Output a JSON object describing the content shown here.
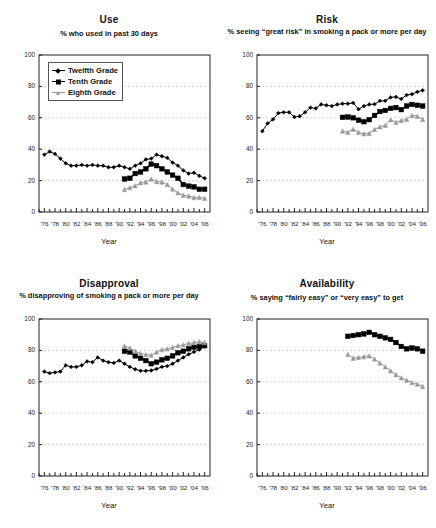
{
  "figure": {
    "background": "#ffffff",
    "axis_label": "Year",
    "y_ticks": [
      "0",
      "20",
      "40",
      "60",
      "80",
      "100"
    ],
    "y_values": [
      0,
      20,
      40,
      60,
      80,
      100
    ],
    "x_tick_labels": [
      "'76",
      "'78",
      "'80",
      "'82",
      "'84",
      "'86",
      "'88",
      "'90",
      "'92",
      "'94",
      "'96",
      "'98",
      "'00",
      "'02",
      "'04",
      "'06"
    ],
    "x_tick_years": [
      1976,
      1978,
      1980,
      1982,
      1984,
      1986,
      1988,
      1990,
      1992,
      1994,
      1996,
      1998,
      2000,
      2002,
      2004,
      2006
    ],
    "x_range": [
      1975,
      2007
    ],
    "grid_color": "#bbbbbb",
    "series_colors": {
      "twelfth": "#000000",
      "tenth": "#000000",
      "eighth": "#9a9a9a"
    },
    "legend": {
      "items": [
        {
          "key": "twelfth",
          "label": "Twelfth Grade",
          "marker": "diamond",
          "color": "#000000"
        },
        {
          "key": "tenth",
          "label": "Tenth Grade",
          "marker": "square",
          "color": "#000000"
        },
        {
          "key": "eighth",
          "label": "Eighth Grade",
          "marker": "triangle",
          "color": "#9a9a9a"
        }
      ]
    }
  },
  "chart_data": [
    {
      "type": "line",
      "panel": "use",
      "title": "Use",
      "subtitle": "% who used in past 30 days",
      "xlabel": "Year",
      "ylabel": "",
      "ylim": [
        0,
        100
      ],
      "xlim": [
        1975,
        2007
      ],
      "grid": true,
      "legend": "inside-top-left",
      "series": [
        {
          "name": "Twelfth Grade",
          "color": "#000000",
          "marker": "diamond",
          "x": [
            1976,
            1977,
            1978,
            1979,
            1980,
            1981,
            1982,
            1983,
            1984,
            1985,
            1986,
            1987,
            1988,
            1989,
            1990,
            1991,
            1992,
            1993,
            1994,
            1995,
            1996,
            1997,
            1998,
            1999,
            2000,
            2001,
            2002,
            2003,
            2004,
            2005,
            2006
          ],
          "values": [
            36.5,
            38.5,
            37.0,
            34.0,
            31.0,
            29.5,
            29.5,
            30.0,
            29.5,
            30.0,
            29.5,
            29.5,
            28.5,
            28.5,
            29.5,
            28.5,
            27.5,
            29.5,
            31.0,
            33.5,
            34.0,
            36.5,
            35.5,
            34.5,
            31.5,
            29.5,
            26.5,
            24.5,
            25.0,
            23.0,
            21.5
          ]
        },
        {
          "name": "Tenth Grade",
          "color": "#000000",
          "marker": "square",
          "x": [
            1991,
            1992,
            1993,
            1994,
            1995,
            1996,
            1997,
            1998,
            1999,
            2000,
            2001,
            2002,
            2003,
            2004,
            2005,
            2006
          ],
          "values": [
            21.0,
            21.5,
            24.5,
            25.5,
            27.5,
            30.5,
            29.5,
            27.5,
            25.5,
            23.5,
            21.5,
            17.5,
            16.5,
            16.0,
            14.5,
            14.5
          ]
        },
        {
          "name": "Eighth Grade",
          "color": "#9a9a9a",
          "marker": "triangle",
          "x": [
            1991,
            1992,
            1993,
            1994,
            1995,
            1996,
            1997,
            1998,
            1999,
            2000,
            2001,
            2002,
            2003,
            2004,
            2005,
            2006
          ],
          "values": [
            14.3,
            15.5,
            16.7,
            18.6,
            19.1,
            21.0,
            19.4,
            19.1,
            17.5,
            14.6,
            12.2,
            10.7,
            10.2,
            9.2,
            9.3,
            8.7
          ]
        }
      ]
    },
    {
      "type": "line",
      "panel": "risk",
      "title": "Risk",
      "subtitle": "% seeing “great risk” in smoking a pack or more per day",
      "xlabel": "Year",
      "ylabel": "",
      "ylim": [
        0,
        100
      ],
      "xlim": [
        1975,
        2007
      ],
      "grid": true,
      "legend": "none",
      "series": [
        {
          "name": "Twelfth Grade",
          "color": "#000000",
          "marker": "diamond",
          "x": [
            1976,
            1977,
            1978,
            1979,
            1980,
            1981,
            1982,
            1983,
            1984,
            1985,
            1986,
            1987,
            1988,
            1989,
            1990,
            1991,
            1992,
            1993,
            1994,
            1995,
            1996,
            1997,
            1998,
            1999,
            2000,
            2001,
            2002,
            2003,
            2004,
            2005,
            2006
          ],
          "values": [
            51.5,
            56.5,
            59.0,
            63.0,
            63.5,
            63.5,
            60.5,
            61.0,
            63.5,
            66.5,
            66.0,
            68.5,
            68.0,
            67.5,
            68.5,
            69.0,
            69.0,
            69.5,
            65.5,
            67.5,
            68.5,
            68.7,
            70.8,
            70.8,
            73.0,
            73.3,
            72.0,
            74.5,
            75.0,
            76.5,
            77.5
          ]
        },
        {
          "name": "Tenth Grade",
          "color": "#000000",
          "marker": "square",
          "x": [
            1991,
            1992,
            1993,
            1994,
            1995,
            1996,
            1997,
            1998,
            1999,
            2000,
            2001,
            2002,
            2003,
            2004,
            2005,
            2006
          ],
          "values": [
            60.3,
            60.5,
            60.0,
            58.5,
            57.5,
            58.8,
            61.5,
            64.0,
            64.7,
            66.0,
            66.5,
            65.2,
            67.5,
            68.5,
            68.0,
            67.5
          ]
        },
        {
          "name": "Eighth Grade",
          "color": "#9a9a9a",
          "marker": "triangle",
          "x": [
            1991,
            1992,
            1993,
            1994,
            1995,
            1996,
            1997,
            1998,
            1999,
            2000,
            2001,
            2002,
            2003,
            2004,
            2005,
            2006
          ],
          "values": [
            51.6,
            50.8,
            52.7,
            50.8,
            49.8,
            50.0,
            52.6,
            54.3,
            55.2,
            58.8,
            57.1,
            58.3,
            59.0,
            61.5,
            61.0,
            59.0
          ]
        }
      ]
    },
    {
      "type": "line",
      "panel": "disapproval",
      "title": "Disapproval",
      "subtitle": "% disapproving of smoking a pack or more per day",
      "xlabel": "Year",
      "ylabel": "",
      "ylim": [
        0,
        100
      ],
      "xlim": [
        1975,
        2007
      ],
      "grid": true,
      "legend": "none",
      "series": [
        {
          "name": "Twelfth Grade",
          "color": "#000000",
          "marker": "diamond",
          "x": [
            1976,
            1977,
            1978,
            1979,
            1980,
            1981,
            1982,
            1983,
            1984,
            1985,
            1986,
            1987,
            1988,
            1989,
            1990,
            1991,
            1992,
            1993,
            1994,
            1995,
            1996,
            1997,
            1998,
            1999,
            2000,
            2001,
            2002,
            2003,
            2004,
            2005,
            2006
          ],
          "values": [
            66.5,
            65.5,
            66.0,
            66.5,
            70.5,
            69.5,
            69.5,
            70.5,
            73.0,
            72.5,
            75.5,
            73.5,
            72.5,
            72.0,
            73.5,
            71.5,
            69.5,
            68.0,
            67.0,
            67.0,
            67.2,
            68.2,
            69.5,
            70.0,
            71.5,
            73.5,
            75.5,
            77.5,
            79.0,
            80.5,
            82.5
          ]
        },
        {
          "name": "Tenth Grade",
          "color": "#000000",
          "marker": "square",
          "x": [
            1991,
            1992,
            1993,
            1994,
            1995,
            1996,
            1997,
            1998,
            1999,
            2000,
            2001,
            2002,
            2003,
            2004,
            2005,
            2006
          ],
          "values": [
            79.5,
            79.0,
            76.5,
            75.0,
            73.5,
            71.5,
            72.5,
            74.0,
            75.0,
            76.5,
            78.5,
            79.5,
            81.0,
            82.0,
            82.5,
            83.0
          ]
        },
        {
          "name": "Eighth Grade",
          "color": "#9a9a9a",
          "marker": "triangle",
          "x": [
            1991,
            1992,
            1993,
            1994,
            1995,
            1996,
            1997,
            1998,
            1999,
            2000,
            2001,
            2002,
            2003,
            2004,
            2005,
            2006
          ],
          "values": [
            82.8,
            81.5,
            79.5,
            78.0,
            77.3,
            77.0,
            79.0,
            80.5,
            81.0,
            82.0,
            83.0,
            83.5,
            84.5,
            85.0,
            85.5,
            85.0
          ]
        }
      ]
    },
    {
      "type": "line",
      "panel": "availability",
      "title": "Availability",
      "subtitle": "% saying “fairly easy” or “very easy” to get",
      "xlabel": "Year",
      "ylabel": "",
      "ylim": [
        0,
        100
      ],
      "xlim": [
        1975,
        2007
      ],
      "grid": true,
      "legend": "none",
      "series": [
        {
          "name": "Tenth Grade",
          "color": "#000000",
          "marker": "square",
          "x": [
            1992,
            1993,
            1994,
            1995,
            1996,
            1997,
            1998,
            1999,
            2000,
            2001,
            2002,
            2003,
            2004,
            2005,
            2006
          ],
          "values": [
            89.0,
            89.5,
            90.0,
            90.5,
            91.5,
            90.0,
            89.0,
            88.0,
            87.0,
            85.0,
            82.5,
            81.0,
            81.5,
            81.0,
            79.5
          ]
        },
        {
          "name": "Eighth Grade",
          "color": "#9a9a9a",
          "marker": "triangle",
          "x": [
            1992,
            1993,
            1994,
            1995,
            1996,
            1997,
            1998,
            1999,
            2000,
            2001,
            2002,
            2003,
            2004,
            2005,
            2006
          ],
          "values": [
            77.5,
            75.0,
            75.5,
            76.0,
            76.5,
            74.5,
            72.0,
            69.5,
            67.0,
            64.5,
            62.5,
            61.0,
            59.5,
            58.5,
            57.0
          ]
        }
      ]
    }
  ]
}
